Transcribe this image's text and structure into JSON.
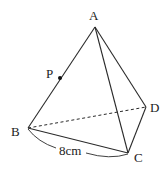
{
  "figure": {
    "type": "triangular pyramid (tetrahedron)",
    "vertices": {
      "A": {
        "label": "A",
        "x": 95,
        "y": 27
      },
      "B": {
        "label": "B",
        "x": 28,
        "y": 128
      },
      "C": {
        "label": "C",
        "x": 128,
        "y": 153
      },
      "D": {
        "label": "D",
        "x": 146,
        "y": 107
      }
    },
    "point_p": {
      "label": "P",
      "x": 60,
      "y": 78,
      "on_edge": "AB"
    },
    "edges_solid": [
      "AB",
      "AC",
      "AD",
      "BC",
      "CD"
    ],
    "edges_dashed": [
      "BD"
    ],
    "measurement": {
      "edge": "BC",
      "label": "8cm"
    }
  },
  "colors": {
    "line": "#2a2a2a",
    "text": "#222222",
    "background": "#ffffff"
  }
}
